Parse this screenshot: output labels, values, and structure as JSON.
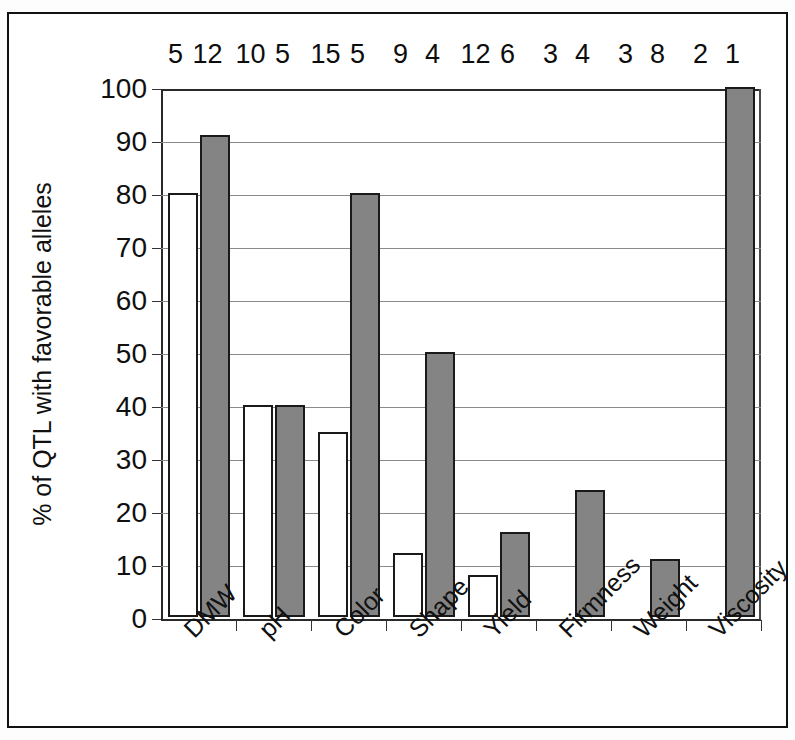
{
  "chart_data": {
    "type": "bar",
    "title": "",
    "subtitle": "",
    "xlabel": "",
    "ylabel": "% of QTL with favorable alleles",
    "ylim": [
      0,
      100
    ],
    "yticks": [
      0,
      10,
      20,
      30,
      40,
      50,
      60,
      70,
      80,
      90,
      100
    ],
    "ytick_labels": [
      "0",
      "10",
      "20",
      "30",
      "40",
      "50",
      "60",
      "70",
      "80",
      "90",
      "100"
    ],
    "grid": "horizontal",
    "legend": "none",
    "categories": [
      "DMW",
      "pH",
      "Color",
      "Shape",
      "Yield",
      "Firmness",
      "Weight",
      "Viscosity"
    ],
    "series": [
      {
        "name": "white-bars",
        "fill": "#ffffff",
        "values": [
          80,
          40,
          35,
          12,
          8,
          0,
          0,
          0
        ]
      },
      {
        "name": "gray-bars",
        "fill": "#848484",
        "values": [
          91,
          40,
          80,
          50,
          16,
          24,
          11,
          100
        ]
      }
    ],
    "top_annotations": [
      {
        "category": "DMW",
        "white_n": "5",
        "gray_n": "12"
      },
      {
        "category": "pH",
        "white_n": "10",
        "gray_n": "5"
      },
      {
        "category": "Color",
        "white_n": "15",
        "gray_n": "5"
      },
      {
        "category": "Shape",
        "white_n": "9",
        "gray_n": "4"
      },
      {
        "category": "Yield",
        "white_n": "12",
        "gray_n": "6"
      },
      {
        "category": "Firmness",
        "white_n": "3",
        "gray_n": "4"
      },
      {
        "category": "Weight",
        "white_n": "3",
        "gray_n": "8"
      },
      {
        "category": "Viscosity",
        "white_n": "2",
        "gray_n": "1"
      }
    ],
    "colors": {
      "series_white": "#ffffff",
      "series_gray": "#848484",
      "bar_outline": "#1a1a1a",
      "gridline": "#8a8a8a",
      "axis": "#2a2a2a",
      "text": "#101010",
      "frame": "#111111",
      "background": "#ffffff"
    }
  }
}
